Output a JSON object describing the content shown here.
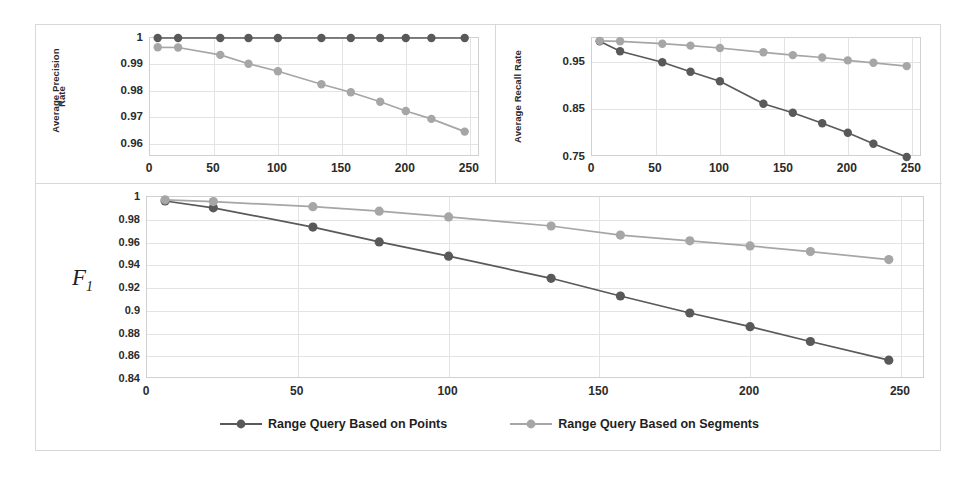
{
  "figure": {
    "series_colors": {
      "points": "#595959",
      "segments": "#a6a6a6"
    },
    "grid_color": "#e3e3e3",
    "legend": {
      "items": [
        {
          "label": "Range Query Based on Points",
          "color": "#595959"
        },
        {
          "label": "Range Query Based on Segments",
          "color": "#a6a6a6"
        }
      ]
    }
  },
  "chart_data": [
    {
      "id": "precision",
      "type": "line",
      "title": "",
      "ylabel": "Average Precision Rate",
      "xlabel": "",
      "x": [
        6,
        22,
        55,
        77,
        100,
        134,
        157,
        180,
        200,
        220,
        246
      ],
      "xlim": [
        0,
        258
      ],
      "ylim": [
        0.955,
        1.0
      ],
      "yticks": [
        1,
        0.99,
        0.98,
        0.97,
        0.96
      ],
      "ytick_labels": [
        "1",
        "0.99",
        "0.98",
        "0.97",
        "0.96"
      ],
      "xticks": [
        0,
        50,
        100,
        150,
        200,
        250
      ],
      "xtick_labels": [
        "0",
        "50",
        "100",
        "150",
        "200",
        "250"
      ],
      "grid": true,
      "series": [
        {
          "name": "Range Query Based on Points",
          "values": [
            1,
            1,
            1,
            1,
            1,
            1,
            1,
            1,
            1,
            1,
            1
          ]
        },
        {
          "name": "Range Query Based on Segments",
          "values": [
            0.9965,
            0.9964,
            0.9936,
            0.9903,
            0.9874,
            0.9825,
            0.9795,
            0.9759,
            0.9724,
            0.9694,
            0.9646
          ]
        }
      ]
    },
    {
      "id": "recall",
      "type": "line",
      "title": "",
      "ylabel": "Average Recall Rate",
      "xlabel": "",
      "x": [
        6,
        22,
        55,
        77,
        100,
        134,
        157,
        180,
        200,
        220,
        246
      ],
      "xlim": [
        0,
        258
      ],
      "ylim": [
        0.75,
        1.0
      ],
      "yticks": [
        0.95,
        0.85,
        0.75
      ],
      "ytick_labels": [
        "0.95",
        "0.85",
        "0.75"
      ],
      "xticks": [
        0,
        50,
        100,
        150,
        200,
        250
      ],
      "xtick_labels": [
        "0",
        "50",
        "100",
        "150",
        "200",
        "250"
      ],
      "grid": true,
      "series": [
        {
          "name": "Range Query Based on Points",
          "values": [
            0.993,
            0.972,
            0.949,
            0.929,
            0.909,
            0.862,
            0.843,
            0.821,
            0.801,
            0.778,
            0.75
          ]
        },
        {
          "name": "Range Query Based on Segments",
          "values": [
            0.994,
            0.993,
            0.988,
            0.984,
            0.979,
            0.97,
            0.964,
            0.959,
            0.953,
            0.948,
            0.941
          ]
        }
      ]
    },
    {
      "id": "f1",
      "type": "line",
      "title": "",
      "ylabel": "F1",
      "xlabel": "",
      "x": [
        6,
        22,
        55,
        77,
        100,
        134,
        157,
        180,
        200,
        220,
        246
      ],
      "xlim": [
        0,
        258
      ],
      "ylim": [
        0.84,
        1.0
      ],
      "yticks": [
        1,
        0.98,
        0.96,
        0.94,
        0.92,
        0.9,
        0.88,
        0.86,
        0.84
      ],
      "ytick_labels": [
        "1",
        "0.98",
        "0.96",
        "0.94",
        "0.92",
        "0.9",
        "0.88",
        "0.86",
        "0.84"
      ],
      "xticks": [
        0,
        50,
        100,
        150,
        200,
        250
      ],
      "xtick_labels": [
        "0",
        "50",
        "100",
        "150",
        "200",
        "250"
      ],
      "grid": true,
      "series": [
        {
          "name": "Range Query Based on Points",
          "values": [
            0.9965,
            0.9905,
            0.9735,
            0.9605,
            0.948,
            0.9285,
            0.913,
            0.898,
            0.886,
            0.873,
            0.8565
          ]
        },
        {
          "name": "Range Query Based on Segments",
          "values": [
            0.9975,
            0.996,
            0.9915,
            0.9875,
            0.9825,
            0.9745,
            0.9665,
            0.9615,
            0.957,
            0.952,
            0.945
          ]
        }
      ]
    }
  ]
}
